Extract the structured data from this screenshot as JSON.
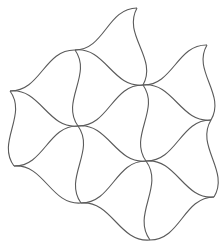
{
  "figure": {
    "stroke_color": "#5a5a5a",
    "background_color": "#ffffff",
    "tile_count_visible": 7,
    "vertices": {
      "v1": [
        137,
        8
      ],
      "v2": [
        75,
        50
      ],
      "v3": [
        207,
        45
      ],
      "v4": [
        143,
        85
      ],
      "v5": [
        10,
        91
      ],
      "v6": [
        211,
        120
      ],
      "v7": [
        78,
        126
      ],
      "v8": [
        146,
        161
      ],
      "v9": [
        14,
        166
      ],
      "v10": [
        214,
        197
      ],
      "v11": [
        81,
        203
      ],
      "v12": [
        150,
        240
      ]
    },
    "edges": [
      {
        "from": "v1",
        "to": "v4",
        "bend": 1
      },
      {
        "from": "v2",
        "to": "v1",
        "bend": 1
      },
      {
        "from": "v2",
        "to": "v4",
        "bend": -1
      },
      {
        "from": "v4",
        "to": "v3",
        "bend": 1
      },
      {
        "from": "v3",
        "to": "v6",
        "bend": 1
      },
      {
        "from": "v4",
        "to": "v6",
        "bend": -1
      },
      {
        "from": "v2",
        "to": "v7",
        "bend": -1
      },
      {
        "from": "v5",
        "to": "v2",
        "bend": 1
      },
      {
        "from": "v5",
        "to": "v7",
        "bend": -1
      },
      {
        "from": "v4",
        "to": "v8",
        "bend": -1
      },
      {
        "from": "v7",
        "to": "v4",
        "bend": 1
      },
      {
        "from": "v7",
        "to": "v8",
        "bend": -1
      },
      {
        "from": "v6",
        "to": "v10",
        "bend": 1
      },
      {
        "from": "v8",
        "to": "v6",
        "bend": 1
      },
      {
        "from": "v8",
        "to": "v10",
        "bend": -1
      },
      {
        "from": "v5",
        "to": "v9",
        "bend": -1
      },
      {
        "from": "v9",
        "to": "v7",
        "bend": 1
      },
      {
        "from": "v9",
        "to": "v11",
        "bend": -1
      },
      {
        "from": "v7",
        "to": "v11",
        "bend": -1
      },
      {
        "from": "v11",
        "to": "v8",
        "bend": 1
      },
      {
        "from": "v8",
        "to": "v12",
        "bend": -1
      },
      {
        "from": "v11",
        "to": "v12",
        "bend": -1
      },
      {
        "from": "v12",
        "to": "v10",
        "bend": 1
      }
    ]
  }
}
